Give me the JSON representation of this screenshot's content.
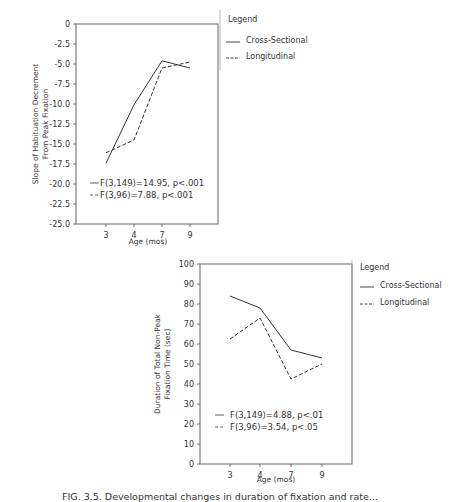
{
  "chart_data": [
    {
      "type": "line",
      "title": "",
      "xlabel": "Age (mos)",
      "ylabel": "Slope of Habituation Decrement From Peak Fixation",
      "ylabel_lines": [
        "Slope of Habituation Decrement",
        "From Peak Fixation"
      ],
      "categories": [
        "3",
        "4",
        "7",
        "9"
      ],
      "ylim": [
        -25.0,
        0
      ],
      "yticks": [
        "0",
        "-2.5",
        "-5.0",
        "-7.5",
        "-10.0",
        "-12.5",
        "-15.0",
        "-17.5",
        "-20.0",
        "-22.5",
        "-25.0"
      ],
      "grid": false,
      "legend": {
        "title": "Legend",
        "position": "right",
        "entries": [
          "Cross-Sectional",
          "Longitudinal"
        ]
      },
      "series": [
        {
          "name": "Cross-Sectional",
          "style": "solid",
          "values": [
            -17.4,
            -10.1,
            -4.6,
            -5.5
          ]
        },
        {
          "name": "Longitudinal",
          "style": "dashed",
          "values": [
            -16.1,
            -14.5,
            -5.5,
            -4.75
          ]
        }
      ],
      "annotations": [
        "F(3,149)=14.95,  p<.001",
        "F(3,96)=7.88,  p<.001"
      ]
    },
    {
      "type": "line",
      "title": "",
      "xlabel": "Age (mos)",
      "ylabel": "Duration of Total Non-Peak Fixation Time (sec)",
      "ylabel_lines": [
        "Duration of Total Non-Peak",
        "Fixation Time (sec)"
      ],
      "categories": [
        "3",
        "4",
        "7",
        "9"
      ],
      "ylim": [
        0,
        100
      ],
      "yticks": [
        "0",
        "10",
        "20",
        "30",
        "40",
        "50",
        "60",
        "70",
        "80",
        "90",
        "100"
      ],
      "grid": false,
      "legend": {
        "title": "Legend",
        "position": "right",
        "entries": [
          "Cross-Sectional",
          "Longitudinal"
        ]
      },
      "series": [
        {
          "name": "Cross-Sectional",
          "style": "solid",
          "values": [
            84,
            78,
            57,
            53
          ]
        },
        {
          "name": "Longitudinal",
          "style": "dashed",
          "values": [
            62.5,
            73,
            42.5,
            50
          ]
        }
      ],
      "annotations": [
        "F(3,149)=4.88,  p<.01",
        "F(3,96)=3.54,  p<.05"
      ]
    }
  ],
  "caption": "FIG. 3.5.  Developmental changes in duration of fixation and rate..."
}
